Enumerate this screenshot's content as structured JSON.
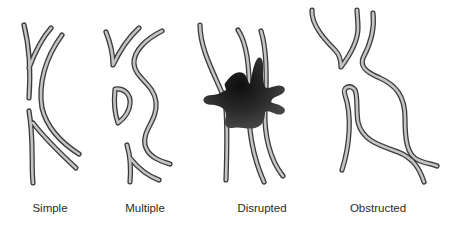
{
  "figure": {
    "colors": {
      "background": "#ffffff",
      "tube_outline": "#3a3a3a",
      "tube_fill": "#c4c4c4",
      "hematoma": "#2b2b2b",
      "label_text": "#2a2a2a"
    },
    "panels": [
      {
        "id": "simple",
        "label": "Simple",
        "label_x": 50
      },
      {
        "id": "multiple",
        "label": "Multiple",
        "label_x": 145
      },
      {
        "id": "disrupted",
        "label": "Disrupted",
        "label_x": 262
      },
      {
        "id": "obstructed",
        "label": "Obstructed",
        "label_x": 378
      }
    ]
  }
}
